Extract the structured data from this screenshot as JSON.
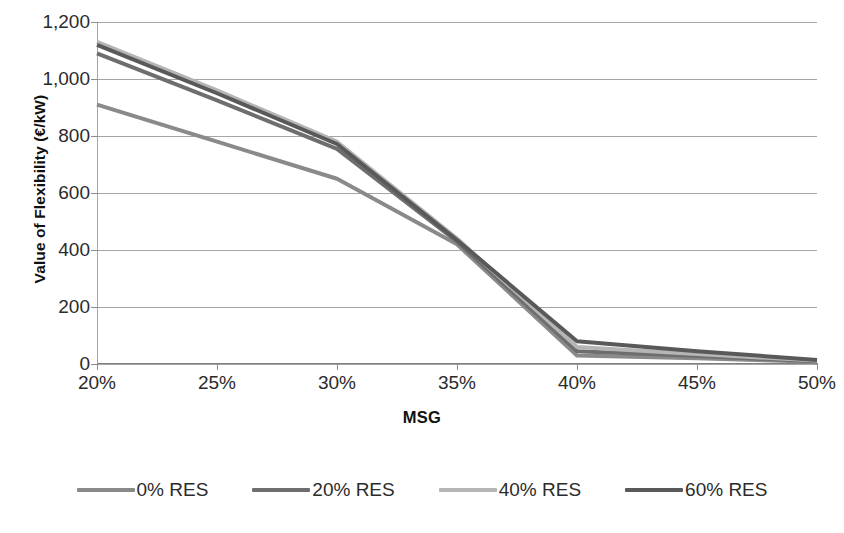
{
  "chart_data": {
    "type": "line",
    "title": "",
    "xlabel": "MSG",
    "ylabel": "Value of Flexibility (€/kW)",
    "x": [
      20,
      25,
      30,
      35,
      40,
      45,
      50
    ],
    "xtick_labels": [
      "20%",
      "25%",
      "30%",
      "35%",
      "40%",
      "45%",
      "50%"
    ],
    "ytick_labels": [
      "0",
      "200",
      "400",
      "600",
      "800",
      "1,000",
      "1,200"
    ],
    "ytick_values": [
      0,
      200,
      400,
      600,
      800,
      1000,
      1200
    ],
    "ylim": [
      0,
      1200
    ],
    "xlim": [
      20,
      50
    ],
    "grid": "horizontal",
    "legend_position": "bottom",
    "series": [
      {
        "name": "0% RES",
        "values": [
          910,
          780,
          650,
          420,
          30,
          20,
          8
        ],
        "color": "#8a8a8a"
      },
      {
        "name": "20% RES",
        "values": [
          1090,
          925,
          755,
          430,
          45,
          28,
          10
        ],
        "color": "#6e6e6e"
      },
      {
        "name": "40% RES",
        "values": [
          1130,
          960,
          780,
          440,
          60,
          35,
          12
        ],
        "color": "#b5b5b5"
      },
      {
        "name": "60% RES",
        "values": [
          1120,
          950,
          772,
          435,
          80,
          45,
          14
        ],
        "color": "#595959"
      }
    ]
  },
  "axes": {
    "y_title": "Value of Flexibility (€/kW)",
    "x_title": "MSG",
    "y_ticks": [
      "1,200",
      "1,000",
      "800",
      "600",
      "400",
      "200",
      "0"
    ],
    "x_ticks": [
      "20%",
      "25%",
      "30%",
      "35%",
      "40%",
      "45%",
      "50%"
    ]
  },
  "legend": {
    "items": [
      {
        "label": "0% RES",
        "color": "#8a8a8a"
      },
      {
        "label": "20% RES",
        "color": "#6e6e6e"
      },
      {
        "label": "40% RES",
        "color": "#b5b5b5"
      },
      {
        "label": "60% RES",
        "color": "#595959"
      }
    ]
  },
  "colors": {
    "gridline": "#a6a6a6",
    "axis": "#7f7f7f",
    "text": "#2b2b2b",
    "background": "#ffffff"
  }
}
